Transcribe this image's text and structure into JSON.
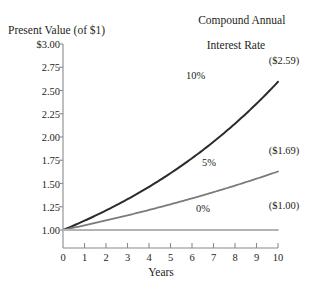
{
  "chart_data": {
    "type": "line",
    "title": "Compound Annual Interest Rate",
    "title_line1": "Compound Annual",
    "title_line2": "Interest Rate",
    "xlabel": "Years",
    "ylabel": "Present Value (of $1)",
    "xlim": [
      0,
      10
    ],
    "ylim": [
      1.0,
      3.0
    ],
    "grid": false,
    "legend_position": "inline-annotations",
    "x": [
      0,
      1,
      2,
      3,
      4,
      5,
      6,
      7,
      8,
      9,
      10
    ],
    "xticks": [
      "0",
      "1",
      "2",
      "3",
      "4",
      "5",
      "6",
      "7",
      "8",
      "9",
      "10"
    ],
    "yticks": [
      "$3.00",
      "2.75",
      "2.50",
      "2.25",
      "2.00",
      "1.75",
      "1.50",
      "1.25",
      "1.00"
    ],
    "ytick_values": [
      3.0,
      2.75,
      2.5,
      2.25,
      2.0,
      1.75,
      1.5,
      1.25,
      1.0
    ],
    "series": [
      {
        "name": "10%",
        "rate": 0.1,
        "color": "#2b2b2b",
        "width": 2.0,
        "end_label": "($2.59)",
        "inline_label": "10%",
        "values": [
          1.0,
          1.1,
          1.21,
          1.33,
          1.46,
          1.61,
          1.77,
          1.95,
          2.14,
          2.36,
          2.59
        ]
      },
      {
        "name": "5%",
        "rate": 0.05,
        "color": "#7b7b7b",
        "width": 1.8,
        "end_label": "($1.69)",
        "inline_label": "5%",
        "values": [
          1.0,
          1.05,
          1.1,
          1.16,
          1.22,
          1.28,
          1.34,
          1.41,
          1.48,
          1.55,
          1.63
        ]
      },
      {
        "name": "0%",
        "rate": 0.0,
        "color": "#b4b4b4",
        "width": 1.8,
        "end_label": "($1.00)",
        "inline_label": "0%",
        "values": [
          1.0,
          1.0,
          1.0,
          1.0,
          1.0,
          1.0,
          1.0,
          1.0,
          1.0,
          1.0,
          1.0
        ]
      }
    ],
    "axis_color": "#8a8a8a",
    "text_color": "#231f20"
  }
}
